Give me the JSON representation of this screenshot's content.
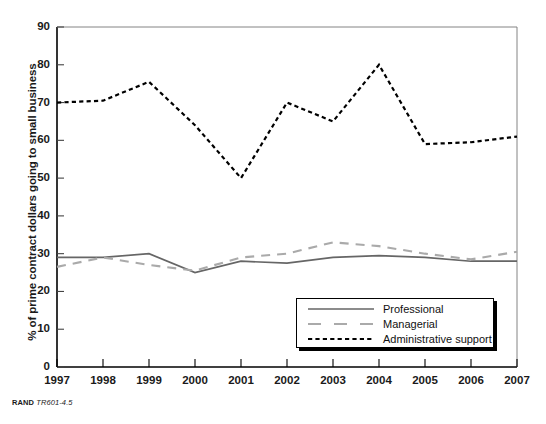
{
  "chart_data": {
    "type": "line",
    "title": "",
    "xlabel": "",
    "ylabel": "% of prime contract dollars going to small business",
    "x": [
      1997,
      1998,
      1999,
      2000,
      2001,
      2002,
      2003,
      2004,
      2005,
      2006,
      2007
    ],
    "xtick_labels": [
      "1997",
      "1998",
      "1999",
      "2000",
      "2001",
      "2002",
      "2003",
      "2004",
      "2005",
      "2006",
      "2007"
    ],
    "ytick_labels": [
      "0",
      "10",
      "20",
      "30",
      "40",
      "50",
      "60",
      "70",
      "80",
      "90"
    ],
    "yticks": [
      0,
      10,
      20,
      30,
      40,
      50,
      60,
      70,
      80,
      90
    ],
    "ylim": [
      0,
      90
    ],
    "xlim": [
      1997,
      2007
    ],
    "grid": false,
    "legend_position": "inside-lower-right",
    "series": [
      {
        "name": "Professional",
        "style": "solid",
        "color": "#666666",
        "values": [
          29,
          29,
          30,
          25,
          28,
          27.5,
          29,
          29.5,
          29,
          28,
          28
        ]
      },
      {
        "name": "Managerial",
        "style": "dashed",
        "color": "#aaaaaa",
        "values": [
          26.5,
          29,
          27,
          25.5,
          29,
          30,
          33,
          32,
          30,
          28.5,
          30.5
        ]
      },
      {
        "name": "Administrative support",
        "style": "dotted",
        "color": "#000000",
        "values": [
          70,
          70.5,
          75.5,
          64,
          50,
          70,
          65,
          80,
          59,
          59.5,
          61
        ]
      }
    ]
  },
  "axis": {
    "y_title": "% of prime contract dollars going to small business"
  },
  "legend": {
    "items": [
      {
        "label": "Professional"
      },
      {
        "label": "Managerial"
      },
      {
        "label": "Administrative support"
      }
    ]
  },
  "footer": {
    "publisher": "RAND",
    "figure_code": "TR601-4.5"
  }
}
